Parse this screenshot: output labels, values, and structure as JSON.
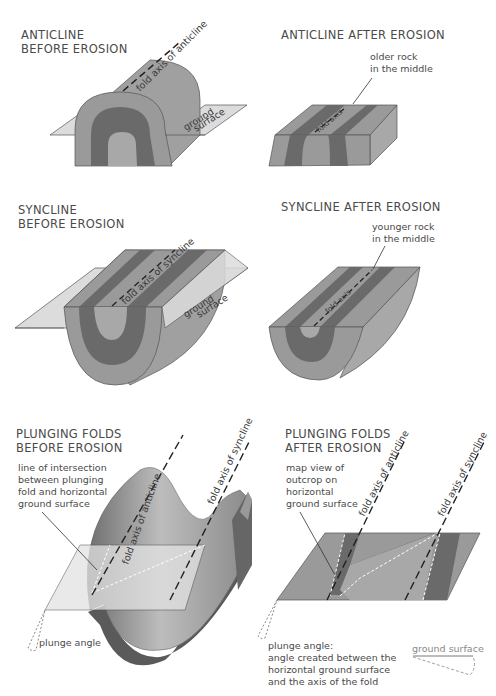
{
  "colors": {
    "outer_layer": "#9a9a9a",
    "middle_layer": "#6a6a6a",
    "inner_layer": "#a8a8a8",
    "ground_plane": "#dcdcdc",
    "side_face": "#b0b0b0",
    "text": "#4a4a4a"
  },
  "panels": {
    "anticline_before": {
      "title": "ANTICLINE\nBEFORE EROSION",
      "axis_label": "fold axis of anticline",
      "ground_label_1": "ground",
      "ground_label_2": "surface"
    },
    "anticline_after": {
      "title": "ANTICLINE AFTER EROSION",
      "callout": "older rock\nin the middle",
      "axis_label": "fold axis"
    },
    "syncline_before": {
      "title": "SYNCLINE\nBEFORE  EROSION",
      "axis_label": "fold axis of syncline",
      "ground_label_1": "ground",
      "ground_label_2": "surface"
    },
    "syncline_after": {
      "title": "SYNCLINE AFTER EROSION",
      "callout": "younger rock\nin the middle",
      "axis_label": "fold axis"
    },
    "plunging_before": {
      "title": "PLUNGING FOLDS\nBEFORE EROSION",
      "callout": "line of intersection\nbetween plunging\nfold and horizontal\nground surface",
      "axis_anticline": "fold axis of anticline",
      "axis_syncline": "fold axis of syncline",
      "plunge_label": "plunge angle"
    },
    "plunging_after": {
      "title": "PLUNGING FOLDS\nAFTER EROSION",
      "callout": "map view of\noutcrop on\nhorizontal\nground surface",
      "axis_anticline": "fold axis of anticline",
      "axis_syncline": "fold axis of syncline",
      "plunge_definition": "plunge angle:\nangle created between the\nhorizontal ground surface\nand the axis of the fold",
      "ground_surface_legend": "ground surface"
    }
  }
}
